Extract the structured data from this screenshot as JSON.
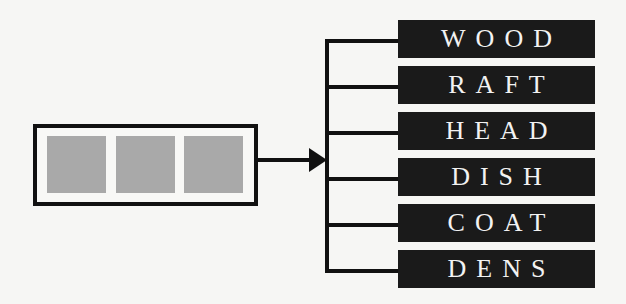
{
  "diagram": {
    "source_block": {
      "slots": 3,
      "slot_color": "#a9a9a9",
      "border_color": "#111111"
    },
    "labels": [
      "WOOD",
      "RAFT",
      "HEAD",
      "DISH",
      "COAT",
      "DENS"
    ],
    "label_background": "#1a1a1a",
    "label_text_color": "#f2f2f2"
  }
}
